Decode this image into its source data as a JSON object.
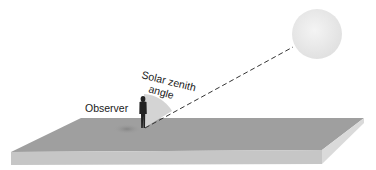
{
  "diagram": {
    "labels": {
      "observer": "Observer",
      "angle_line1": "Solar zenith",
      "angle_line2": "angle"
    },
    "colors": {
      "slab_top": "#9e9e9e",
      "slab_front": "#c4c4c4",
      "slab_side": "#d8d8d8",
      "sun": "#ececec",
      "wedge": "#d2d2d2",
      "figure": "#222222",
      "line": "#333333"
    }
  }
}
